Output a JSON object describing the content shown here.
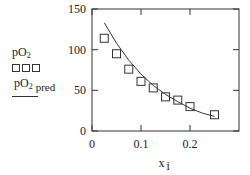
{
  "legend": {
    "series1_label": "pO",
    "series1_sub": "2",
    "series2_label": "pO",
    "series2_sub": "2",
    "series2_suffix": "pred"
  },
  "chart_data": {
    "type": "scatter",
    "title": "",
    "xlabel": "x",
    "xlabel_sub": "i",
    "ylabel": "",
    "xlim": [
      0,
      0.3
    ],
    "ylim": [
      0,
      150
    ],
    "x_ticks": [
      "0",
      "0.1",
      "0.2"
    ],
    "y_ticks": [
      "0",
      "50",
      "100",
      "150"
    ],
    "grid": false,
    "legend_position": "left",
    "series": [
      {
        "name": "pO2",
        "style": "square-markers",
        "x": [
          0.025,
          0.05,
          0.075,
          0.1,
          0.125,
          0.15,
          0.175,
          0.2,
          0.25
        ],
        "y": [
          114,
          95,
          76,
          61,
          53,
          42,
          38,
          30,
          20
        ]
      },
      {
        "name": "pO2 pred",
        "style": "line",
        "x": [
          0.025,
          0.05,
          0.075,
          0.1,
          0.125,
          0.15,
          0.175,
          0.2,
          0.225,
          0.25
        ],
        "y": [
          133,
          108,
          87,
          70,
          56,
          45,
          36,
          28,
          22,
          18
        ]
      }
    ]
  }
}
